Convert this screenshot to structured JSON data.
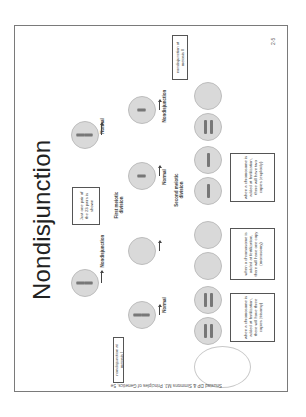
{
  "slide": {
    "title": "Nondisjunction",
    "page_number": "2-5",
    "credit": "Snustad DP & Simmons MJ. Principles of Genetics, 5e",
    "note_box": "Just one pair of the 23 pairs is shown",
    "labels": {
      "meiosis1_left": "Nondisjunction",
      "meiosis1_right": "Normal",
      "first_division": "First meiotic division",
      "second_division": "Second meiotic division",
      "row2_a": "Normal",
      "row2_b": "Nondisjunction",
      "row2_c": "Normal",
      "row2_d": "Nondisjunction"
    },
    "scenario_boxes": {
      "meiosis1": "nondisjunction at meiosis I",
      "meiosis2": "nondisjunction at meiosis II"
    },
    "outcome_boxes": [
      "when a chromosome is added at fertilization, there will have three copies (trisomy)",
      "when a chromosome is added at fertilization, there will have one copy (monosomy)",
      "when a chromosome is added at fertilization, there will have two copies (euploidy)"
    ]
  }
}
